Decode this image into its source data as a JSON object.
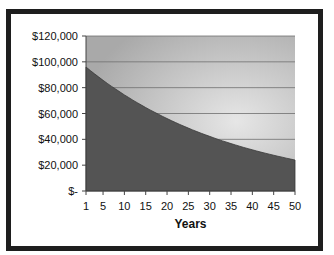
{
  "chart_data": {
    "type": "area",
    "title": "",
    "xlabel": "Years",
    "ylabel": "",
    "ylim": [
      0,
      120000
    ],
    "xlim": [
      1,
      50
    ],
    "grid": true,
    "legend": "none",
    "y_tick_labels": [
      "$-",
      "$20,000",
      "$40,000",
      "$60,000",
      "$80,000",
      "$100,000",
      "$120,000"
    ],
    "y_tick_values": [
      0,
      20000,
      40000,
      60000,
      80000,
      100000,
      120000
    ],
    "x_tick_labels": [
      "1",
      "5",
      "10",
      "15",
      "20",
      "25",
      "30",
      "35",
      "40",
      "45",
      "50"
    ],
    "x_tick_values": [
      1,
      5,
      10,
      15,
      20,
      25,
      30,
      35,
      40,
      45,
      50
    ],
    "x": [
      1,
      2,
      3,
      4,
      5,
      6,
      7,
      8,
      9,
      10,
      11,
      12,
      13,
      14,
      15,
      16,
      17,
      18,
      19,
      20,
      21,
      22,
      23,
      24,
      25,
      26,
      27,
      28,
      29,
      30,
      31,
      32,
      33,
      34,
      35,
      36,
      37,
      38,
      39,
      40,
      41,
      42,
      43,
      44,
      45,
      46,
      47,
      48,
      49,
      50
    ],
    "series": [
      {
        "name": "Value",
        "values": [
          96000,
          93300,
          90700,
          88200,
          85700,
          83300,
          81000,
          78800,
          76600,
          74400,
          72400,
          70300,
          68400,
          66500,
          64600,
          62800,
          61100,
          59400,
          57700,
          56100,
          54500,
          53000,
          51500,
          50100,
          48700,
          47300,
          46000,
          44700,
          43500,
          42300,
          41100,
          39900,
          38800,
          37800,
          36700,
          35700,
          34700,
          33700,
          32800,
          31900,
          31000,
          30100,
          29300,
          28500,
          27700,
          26900,
          26200,
          25400,
          24700,
          24000
        ]
      }
    ]
  },
  "colors": {
    "frame": "#1e1e1e",
    "area_fill": "#545454",
    "area_edge": "#3a3a3a",
    "plot_bg_outer": "#a9a9a9",
    "plot_bg_inner": "#e6e6e6",
    "gridline": "#6e6e6e",
    "axis": "#444444"
  }
}
